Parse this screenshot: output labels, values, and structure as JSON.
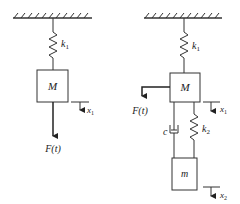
{
  "figures": [
    {
      "name": "single-dof-system",
      "spring_label": "k",
      "spring_sub": "1",
      "mass_label": "M",
      "force_label": "F(t)",
      "disp_label": "x",
      "disp_sub": "1"
    },
    {
      "name": "two-dof-system-with-absorber",
      "spring1_label": "k",
      "spring1_sub": "1",
      "mass_label": "M",
      "force_label": "F(t)",
      "disp1_label": "x",
      "disp1_sub": "1",
      "damper_label": "c",
      "spring2_label": "k",
      "spring2_sub": "2",
      "mass2_label": "m",
      "disp2_label": "x",
      "disp2_sub": "2"
    }
  ],
  "colors": {
    "stroke": "#333333",
    "background": "#ffffff"
  }
}
